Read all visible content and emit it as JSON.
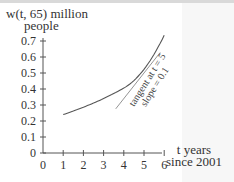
{
  "chart_data": {
    "type": "line",
    "title": "",
    "ylabel_line1": "w(t, 65) million",
    "ylabel_line2": "people",
    "xlabel_line1": "t years",
    "xlabel_line2": "since 2001",
    "x_ticks": [
      "0",
      "1",
      "2",
      "3",
      "4",
      "5",
      "6"
    ],
    "y_ticks": [
      "0",
      "0.1",
      "0.2",
      "0.3",
      "0.4",
      "0.5",
      "0.6",
      "0.7"
    ],
    "xlim": [
      0,
      6
    ],
    "ylim": [
      0,
      0.7
    ],
    "grid": false,
    "series": [
      {
        "name": "w(t, 65)",
        "x": [
          1,
          2,
          3,
          4,
          5,
          6
        ],
        "values": [
          0.24,
          0.28,
          0.33,
          0.4,
          0.5,
          0.7
        ]
      }
    ],
    "annotations": [
      {
        "text_line1": "tangent at t = 5",
        "text_line2": "slope = 0.1",
        "type": "tangent",
        "at_x": 5,
        "slope": 0.1
      }
    ]
  }
}
